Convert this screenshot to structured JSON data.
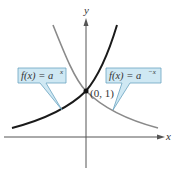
{
  "diagram": {
    "axes": {
      "x_label": "x",
      "y_label": "y"
    },
    "point": {
      "label": "(0, 1)"
    },
    "callouts": {
      "left": {
        "label": "f(x) = a",
        "exponent": "x"
      },
      "right": {
        "label": "f(x) = a",
        "exponent": "−x"
      }
    },
    "colors": {
      "callout_fill": "#cfe8f3",
      "callout_stroke": "#6aa3c0",
      "curve_growth": "#1a1a1a",
      "curve_decay": "#888888",
      "axis": "#555555"
    }
  }
}
